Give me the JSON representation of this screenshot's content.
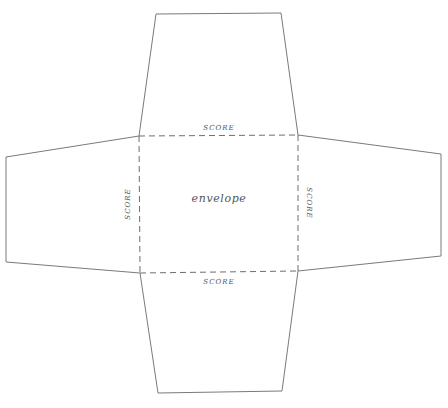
{
  "diagram": {
    "center_label": "envelope",
    "score_labels": {
      "top": "SCORE",
      "bottom": "SCORE",
      "left": "SCORE",
      "right": "SCORE"
    },
    "colors": {
      "background": "#ffffff",
      "cut_line": "#7a7a7a",
      "score_line": "#6e6e6e",
      "text": "#555555"
    }
  }
}
